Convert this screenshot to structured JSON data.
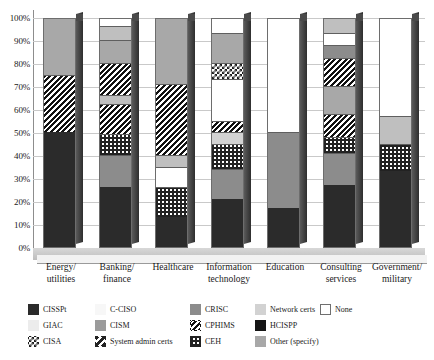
{
  "chart_data": {
    "type": "bar",
    "subtype": "stacked-100-percent-3d",
    "title": "",
    "xlabel": "",
    "ylabel": "",
    "ylim": [
      0,
      100
    ],
    "ytick_labels": [
      "100%",
      "90%",
      "80%",
      "70%",
      "60%",
      "50%",
      "40%",
      "30%",
      "20%",
      "10%",
      "0%"
    ],
    "ytick_values": [
      100,
      90,
      80,
      70,
      60,
      50,
      40,
      30,
      20,
      10,
      0
    ],
    "grid": true,
    "legend_position": "bottom",
    "categories": [
      "Energy/\nutilities",
      "Banking/\nfinance",
      "Healthcare",
      "Information\ntechnology",
      "Education",
      "Consulting\nservices",
      "Government/\nmilitary"
    ],
    "series": [
      {
        "name": "CISSPt",
        "key": "cissp",
        "values": [
          50,
          26,
          13,
          21,
          17,
          27,
          33
        ]
      },
      {
        "name": "CPHIMS",
        "key": "cphims",
        "values": [
          25,
          27,
          5,
          5,
          0,
          10,
          0
        ]
      },
      {
        "name": "CEH",
        "key": "ceh",
        "values": [
          0,
          9,
          13,
          11,
          0,
          7,
          12
        ]
      },
      {
        "name": "CRISC",
        "key": "crisc",
        "values": [
          0,
          14,
          0,
          18,
          33,
          14,
          0
        ]
      },
      {
        "name": "Other (specify)",
        "key": "other",
        "values": [
          25,
          10,
          0,
          16,
          0,
          13,
          12
        ]
      },
      {
        "name": "Network certs",
        "key": "net",
        "values": [
          0,
          6,
          38,
          18,
          0,
          9,
          0
        ]
      },
      {
        "name": "GIAC",
        "key": "giac",
        "values": [
          0,
          4,
          5,
          0,
          0,
          5,
          0
        ]
      },
      {
        "name": "None",
        "key": "none",
        "values": [
          0,
          4,
          26,
          11,
          50,
          15,
          43
        ]
      }
    ]
  },
  "legend": {
    "entries": [
      {
        "label": "CISSPt",
        "fill": "f-cissp",
        "bordered": false
      },
      {
        "label": "GIAC",
        "fill": "f-giac",
        "bordered": false
      },
      {
        "label": "CISA",
        "fill": "f-cisa",
        "bordered": false
      },
      {
        "label": "C-CISO",
        "fill": "f-cciso",
        "bordered": false
      },
      {
        "label": "CISM",
        "fill": "f-cism",
        "bordered": false
      },
      {
        "label": "System admin certs",
        "fill": "f-sysadmin",
        "bordered": false
      },
      {
        "label": "CRISC",
        "fill": "f-crisc",
        "bordered": false
      },
      {
        "label": "CPHIMS",
        "fill": "f-cphims",
        "bordered": false
      },
      {
        "label": "CEH",
        "fill": "f-ceh",
        "bordered": false
      },
      {
        "label": "Network certs",
        "fill": "f-net",
        "bordered": false
      },
      {
        "label": "HCISPP",
        "fill": "f-hcispp",
        "bordered": false
      },
      {
        "label": "Other (specify)",
        "fill": "f-other",
        "bordered": false
      },
      {
        "label": "None",
        "fill": "f-none",
        "bordered": true
      }
    ]
  },
  "bars": [
    {
      "category": "Energy/\nutilities",
      "segments": [
        {
          "series": "CISSPt",
          "fill": "f-cissp",
          "from": 0,
          "to": 50
        },
        {
          "series": "CPHIMS",
          "fill": "f-cphims",
          "from": 50,
          "to": 75
        },
        {
          "series": "Other (specify)",
          "fill": "f-other",
          "from": 75,
          "to": 100
        }
      ]
    },
    {
      "category": "Banking/\nfinance",
      "segments": [
        {
          "series": "CISSPt",
          "fill": "f-cissp",
          "from": 0,
          "to": 26
        },
        {
          "series": "CRISC",
          "fill": "f-crisc",
          "from": 26,
          "to": 40
        },
        {
          "series": "CEH",
          "fill": "f-ceh",
          "from": 40,
          "to": 49
        },
        {
          "series": "CPHIMS",
          "fill": "f-cphims",
          "from": 49,
          "to": 62
        },
        {
          "series": "Network certs",
          "fill": "f-ltgray",
          "from": 62,
          "to": 66
        },
        {
          "series": "CPHIMS",
          "fill": "f-cphims",
          "from": 66,
          "to": 80
        },
        {
          "series": "Other (specify)",
          "fill": "f-other",
          "from": 80,
          "to": 90
        },
        {
          "series": "GIAC",
          "fill": "f-ltgray",
          "from": 90,
          "to": 96
        },
        {
          "series": "None",
          "fill": "f-none",
          "from": 96,
          "to": 100
        }
      ]
    },
    {
      "category": "Healthcare",
      "segments": [
        {
          "series": "CISSPt",
          "fill": "f-cissp",
          "from": 0,
          "to": 13
        },
        {
          "series": "CEH",
          "fill": "f-ceh",
          "from": 13,
          "to": 26
        },
        {
          "series": "None",
          "fill": "f-none",
          "from": 26,
          "to": 35
        },
        {
          "series": "GIAC",
          "fill": "f-ltgray",
          "from": 35,
          "to": 40
        },
        {
          "series": "CPHIMS",
          "fill": "f-cphims",
          "from": 40,
          "to": 71
        },
        {
          "series": "Network certs",
          "fill": "f-other",
          "from": 71,
          "to": 100
        }
      ]
    },
    {
      "category": "Information\ntechnology",
      "segments": [
        {
          "series": "CISSPt",
          "fill": "f-cissp",
          "from": 0,
          "to": 21
        },
        {
          "series": "CRISC",
          "fill": "f-crisc",
          "from": 21,
          "to": 34
        },
        {
          "series": "CEH",
          "fill": "f-ceh",
          "from": 34,
          "to": 45
        },
        {
          "series": "Network certs",
          "fill": "f-net",
          "from": 45,
          "to": 50
        },
        {
          "series": "CPHIMS",
          "fill": "f-cphims",
          "from": 50,
          "to": 55
        },
        {
          "series": "None",
          "fill": "f-none",
          "from": 55,
          "to": 73
        },
        {
          "series": "CISA",
          "fill": "f-cisa",
          "from": 73,
          "to": 80
        },
        {
          "series": "Other (specify)",
          "fill": "f-other",
          "from": 80,
          "to": 93
        },
        {
          "series": "None",
          "fill": "f-none",
          "from": 93,
          "to": 100
        }
      ]
    },
    {
      "category": "Education",
      "segments": [
        {
          "series": "CISSPt",
          "fill": "f-cissp",
          "from": 0,
          "to": 17
        },
        {
          "series": "CRISC",
          "fill": "f-crisc",
          "from": 17,
          "to": 50
        },
        {
          "series": "None",
          "fill": "f-none",
          "from": 50,
          "to": 100
        }
      ]
    },
    {
      "category": "Consulting\nservices",
      "segments": [
        {
          "series": "CISSPt",
          "fill": "f-cissp",
          "from": 0,
          "to": 27
        },
        {
          "series": "CRISC",
          "fill": "f-crisc",
          "from": 27,
          "to": 41
        },
        {
          "series": "CEH",
          "fill": "f-ceh",
          "from": 41,
          "to": 48
        },
        {
          "series": "CPHIMS",
          "fill": "f-cphims",
          "from": 48,
          "to": 58
        },
        {
          "series": "Other (specify)",
          "fill": "f-other",
          "from": 58,
          "to": 70
        },
        {
          "series": "CPHIMS",
          "fill": "f-cphims",
          "from": 70,
          "to": 82
        },
        {
          "series": "Network certs",
          "fill": "f-crisc",
          "from": 82,
          "to": 88
        },
        {
          "series": "None",
          "fill": "f-none",
          "from": 88,
          "to": 93
        },
        {
          "series": "GIAC",
          "fill": "f-ltgray",
          "from": 93,
          "to": 100
        }
      ]
    },
    {
      "category": "Government/\nmilitary",
      "segments": [
        {
          "series": "CISSPt",
          "fill": "f-cissp",
          "from": 0,
          "to": 33
        },
        {
          "series": "CEH",
          "fill": "f-ceh",
          "from": 33,
          "to": 45
        },
        {
          "series": "Other (specify)",
          "fill": "f-ltgray",
          "from": 45,
          "to": 57
        },
        {
          "series": "None",
          "fill": "f-none",
          "from": 57,
          "to": 100
        }
      ]
    }
  ]
}
